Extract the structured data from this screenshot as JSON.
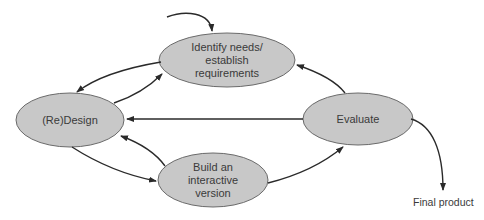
{
  "diagram": {
    "type": "lifecycle-cycle",
    "colors": {
      "node_fill": "#c8c8c8",
      "node_stroke": "#6a6a6a",
      "arrow": "#2a2a2a",
      "text": "#3a3a3a"
    },
    "nodes": [
      {
        "id": "identify",
        "label": "Identify needs/\nestablish\nrequirements"
      },
      {
        "id": "design",
        "label": "(Re)Design"
      },
      {
        "id": "evaluate",
        "label": "Evaluate"
      },
      {
        "id": "build",
        "label": "Build an\ninteractive\nversion"
      }
    ],
    "final_label": "Final product",
    "edges": [
      {
        "from": "start",
        "to": "identify"
      },
      {
        "from": "identify",
        "to": "design"
      },
      {
        "from": "design",
        "to": "identify"
      },
      {
        "from": "evaluate",
        "to": "identify"
      },
      {
        "from": "evaluate",
        "to": "design"
      },
      {
        "from": "design",
        "to": "build"
      },
      {
        "from": "build",
        "to": "design"
      },
      {
        "from": "build",
        "to": "evaluate"
      },
      {
        "from": "evaluate",
        "to": "final"
      }
    ]
  }
}
